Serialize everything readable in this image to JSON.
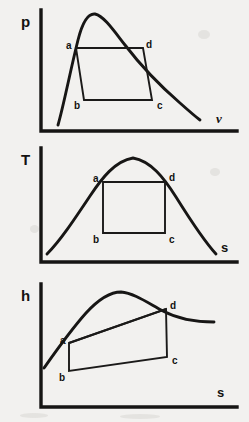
{
  "figure": {
    "background_color": "#f2f1ef",
    "ink_color": "#161514"
  },
  "charts": [
    {
      "id": "pv",
      "type": "line",
      "title": "p-v diagram",
      "ylabel": "p",
      "xlabel": "v",
      "xlabel_style": "italic",
      "grid": false,
      "legend": false,
      "curves": [
        {
          "name": "saturation-dome",
          "description": "vapour dome, peak near mid-left, long tail falling to the right",
          "points": [
            [
              58,
              125
            ],
            [
              62,
              108
            ],
            [
              66,
              88
            ],
            [
              70,
              68
            ],
            [
              74,
              52
            ],
            [
              78,
              38
            ],
            [
              82,
              26
            ],
            [
              86,
              18
            ],
            [
              90,
              14
            ],
            [
              95,
              14
            ],
            [
              101,
              18
            ],
            [
              108,
              25
            ],
            [
              116,
              34
            ],
            [
              125,
              45
            ],
            [
              134,
              55
            ],
            [
              144,
              66
            ],
            [
              155,
              78
            ],
            [
              167,
              90
            ],
            [
              180,
              103
            ],
            [
              192,
              113
            ],
            [
              200,
              120
            ]
          ]
        }
      ],
      "cycle": {
        "name": "abcd-cycle",
        "closed": true,
        "states": [
          {
            "label": "a",
            "x": 76,
            "y": 48,
            "label_x": 66,
            "label_y": 41
          },
          {
            "label": "b",
            "x": 84,
            "y": 100,
            "label_x": 74,
            "label_y": 101
          },
          {
            "label": "c",
            "x": 152,
            "y": 100,
            "label_x": 157,
            "label_y": 101
          },
          {
            "label": "d",
            "x": 143,
            "y": 48,
            "label_x": 146,
            "label_y": 40
          }
        ]
      },
      "axes": {
        "origin": [
          41,
          131
        ],
        "y_top": 10,
        "x_right": 237
      }
    },
    {
      "id": "ts",
      "type": "line",
      "title": "T-s diagram",
      "ylabel": "T",
      "xlabel": "s",
      "xlabel_style": "bold",
      "grid": false,
      "legend": false,
      "curves": [
        {
          "name": "saturation-dome",
          "description": "symmetric bell-shaped vapour dome",
          "points": [
            [
              47,
              114
            ],
            [
              55,
              106
            ],
            [
              63,
              97
            ],
            [
              71,
              86
            ],
            [
              79,
              74
            ],
            [
              88,
              60
            ],
            [
              97,
              48
            ],
            [
              106,
              38
            ],
            [
              115,
              28
            ],
            [
              124,
              21
            ],
            [
              133,
              18
            ],
            [
              142,
              20
            ],
            [
              151,
              26
            ],
            [
              160,
              35
            ],
            [
              169,
              46
            ],
            [
              177,
              58
            ],
            [
              185,
              70
            ],
            [
              193,
              82
            ],
            [
              201,
              94
            ],
            [
              209,
              105
            ],
            [
              216,
              114
            ]
          ]
        }
      ],
      "cycle": {
        "name": "abcd-rectangle",
        "closed": true,
        "states": [
          {
            "label": "a",
            "x": 103,
            "y": 42,
            "label_x": 93,
            "label_y": 35
          },
          {
            "label": "b",
            "x": 103,
            "y": 93,
            "label_x": 93,
            "label_y": 95
          },
          {
            "label": "c",
            "x": 165,
            "y": 93,
            "label_x": 169,
            "label_y": 95
          },
          {
            "label": "d",
            "x": 165,
            "y": 42,
            "label_x": 169,
            "label_y": 34
          }
        ]
      },
      "axes": {
        "origin": [
          41,
          122
        ],
        "y_top": 8,
        "x_right": 237
      }
    },
    {
      "id": "hs",
      "type": "line",
      "title": "h-s diagram",
      "ylabel": "h",
      "xlabel": "s",
      "xlabel_style": "bold",
      "grid": false,
      "legend": false,
      "curves": [
        {
          "name": "enthalpy-saturation-curve",
          "description": "rises steeply from lower left, rounded peak left of centre, gentle fall to the right",
          "points": [
            [
              44,
              92
            ],
            [
              51,
              82
            ],
            [
              58,
              72
            ],
            [
              65,
              62
            ],
            [
              72,
              52
            ],
            [
              80,
              42
            ],
            [
              89,
              32
            ],
            [
              99,
              24
            ],
            [
              110,
              18
            ],
            [
              121,
              16
            ],
            [
              132,
              19
            ],
            [
              142,
              24
            ],
            [
              152,
              29
            ],
            [
              162,
              34
            ],
            [
              172,
              39
            ],
            [
              183,
              43
            ],
            [
              194,
              45
            ],
            [
              205,
              46
            ],
            [
              214,
              46
            ]
          ]
        }
      ],
      "cycle": {
        "name": "abcd-cycle",
        "closed": true,
        "states": [
          {
            "label": "a",
            "x": 69,
            "y": 67,
            "label_x": 60,
            "label_y": 60
          },
          {
            "label": "b",
            "x": 69,
            "y": 95,
            "label_x": 59,
            "label_y": 97
          },
          {
            "label": "c",
            "x": 167,
            "y": 81,
            "label_x": 172,
            "label_y": 80
          },
          {
            "label": "d",
            "x": 166,
            "y": 33,
            "label_x": 170,
            "label_y": 25
          }
        ]
      },
      "axes": {
        "origin": [
          41,
          131
        ],
        "y_top": 8,
        "x_right": 237
      }
    }
  ]
}
